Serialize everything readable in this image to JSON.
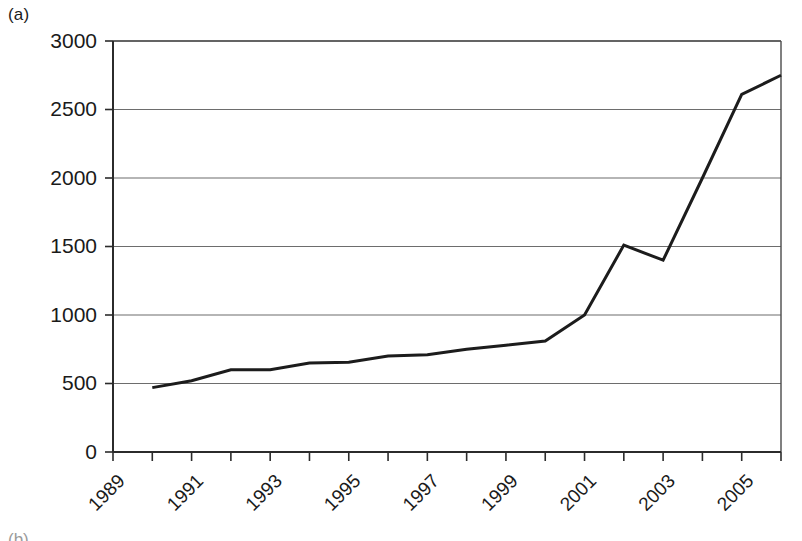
{
  "figure": {
    "panel_label": "(a)",
    "next_panel_label": "(b)"
  },
  "chart_data": {
    "type": "line",
    "title": "",
    "subtitle": "",
    "xlabel": "",
    "ylabel": "",
    "xlim": [
      1989,
      2006
    ],
    "ylim": [
      0,
      3000
    ],
    "grid": true,
    "grid_axis": "y",
    "legend": false,
    "legend_position": "none",
    "line_color": "#1c1c1c",
    "line_width": 3,
    "x": [
      1990,
      1991,
      1992,
      1993,
      1994,
      1995,
      1996,
      1997,
      1998,
      1999,
      2000,
      2001,
      2002,
      2003,
      2004,
      2005,
      2006
    ],
    "values": [
      470,
      520,
      600,
      600,
      650,
      655,
      700,
      710,
      750,
      780,
      810,
      1000,
      1510,
      1400,
      2000,
      2610,
      2750
    ],
    "series": [
      {
        "name": "series-1",
        "values": [
          470,
          520,
          600,
          600,
          650,
          655,
          700,
          710,
          750,
          780,
          810,
          1000,
          1510,
          1400,
          2000,
          2610,
          2750
        ]
      }
    ],
    "y_ticks": [
      0,
      500,
      1000,
      1500,
      2000,
      2500,
      3000
    ],
    "y_tick_labels": [
      "0",
      "500",
      "1000",
      "1500",
      "2000",
      "2500",
      "3000"
    ],
    "x_ticks": [
      1989,
      1990,
      1991,
      1992,
      1993,
      1994,
      1995,
      1996,
      1997,
      1998,
      1999,
      2000,
      2001,
      2002,
      2003,
      2004,
      2005,
      2006
    ],
    "x_tick_labels": [
      "1989",
      "",
      "1991",
      "",
      "1993",
      "",
      "1995",
      "",
      "1997",
      "",
      "1999",
      "",
      "2001",
      "",
      "2003",
      "",
      "2005",
      ""
    ],
    "x_labeled_ticks": [
      1989,
      1991,
      1993,
      1995,
      1997,
      1999,
      2001,
      2003,
      2005
    ],
    "x_label_rotation": -45
  }
}
